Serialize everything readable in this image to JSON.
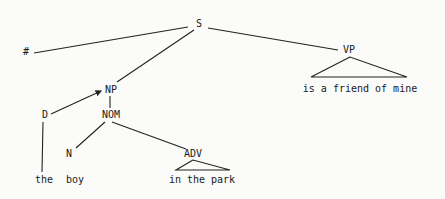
{
  "diagram": {
    "type": "syntax-tree",
    "nodes": {
      "S": {
        "label": "S",
        "x": 199,
        "y": 24
      },
      "HASH": {
        "label": "#",
        "x": 26,
        "y": 51
      },
      "VP": {
        "label": "VP",
        "x": 349,
        "y": 50
      },
      "NP": {
        "label": "NP",
        "x": 111,
        "y": 90
      },
      "D": {
        "label": "D",
        "x": 45,
        "y": 115
      },
      "NOM": {
        "label": "NOM",
        "x": 111,
        "y": 115
      },
      "N": {
        "label": "N",
        "x": 69,
        "y": 154
      },
      "ADV": {
        "label": "ADV",
        "x": 193,
        "y": 154
      }
    },
    "leaves": {
      "vp_phrase": {
        "text": "is a friend of mine",
        "x": 360,
        "y": 89
      },
      "the": {
        "text": "the",
        "x": 45,
        "y": 180
      },
      "boy": {
        "text": "boy",
        "x": 75,
        "y": 180
      },
      "adv_phrase": {
        "text": "in the park",
        "x": 202,
        "y": 180
      }
    },
    "edges": [
      {
        "from": "S",
        "to": "#"
      },
      {
        "from": "S",
        "to": "NP"
      },
      {
        "from": "S",
        "to": "VP"
      },
      {
        "from": "D",
        "to": "NP",
        "arrow": true
      },
      {
        "from": "NP",
        "to": "NOM"
      },
      {
        "from": "D",
        "to": "the"
      },
      {
        "from": "NOM",
        "to": "N"
      },
      {
        "from": "NOM",
        "to": "ADV"
      }
    ],
    "triangles": [
      {
        "under": "VP",
        "covers": "is a friend of mine"
      },
      {
        "under": "ADV",
        "covers": "in the park"
      }
    ]
  }
}
